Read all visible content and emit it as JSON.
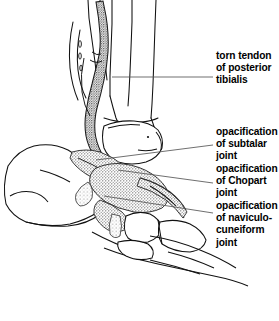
{
  "figure": {
    "kind": "medical-line-illustration",
    "background_color": "#ffffff",
    "ink_color": "#000000",
    "width": 279,
    "height": 321
  },
  "labels": [
    {
      "id": "torn-tendon",
      "lines": [
        "torn tendon",
        "of posterior",
        "tibialis"
      ],
      "leader_y": 77
    },
    {
      "id": "subtalar",
      "lines": [
        "opacification",
        "of subtalar",
        "joint"
      ],
      "leader_y": 145
    },
    {
      "id": "chopart",
      "lines": [
        "opacification",
        "of Chopart",
        "joint"
      ],
      "leader_y": 183
    },
    {
      "id": "naviculo-cuneiform",
      "lines": [
        "opacification",
        "of naviculo-",
        "cuneiform",
        "joint"
      ],
      "leader_y": 213
    }
  ],
  "leaders": [
    {
      "id": "leader-torn-tendon",
      "path": "M 213,77 L 112,77"
    },
    {
      "id": "leader-subtalar",
      "path": "M 213,145 L 96,160"
    },
    {
      "id": "leader-chopart",
      "path": "M 213,183 L 118,170"
    },
    {
      "id": "leader-naviculo",
      "path": "M 213,213 L 104,196"
    }
  ]
}
